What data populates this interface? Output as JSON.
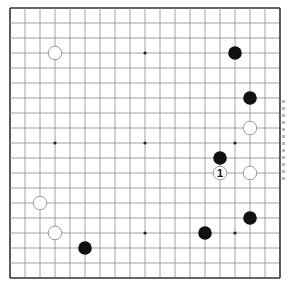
{
  "board": {
    "size": 19,
    "origin_x": 10,
    "origin_y": 8,
    "spacing": 15,
    "line_color": "#8a8a8a",
    "border_color": "#333333",
    "star_points": [
      [
        3,
        3
      ],
      [
        9,
        3
      ],
      [
        15,
        3
      ],
      [
        3,
        9
      ],
      [
        9,
        9
      ],
      [
        15,
        9
      ],
      [
        3,
        15
      ],
      [
        9,
        15
      ],
      [
        15,
        15
      ]
    ],
    "stones": [
      {
        "color": "white",
        "col": 3,
        "row": 3
      },
      {
        "color": "black",
        "col": 15,
        "row": 3
      },
      {
        "color": "black",
        "col": 16,
        "row": 6
      },
      {
        "color": "white",
        "col": 16,
        "row": 8
      },
      {
        "color": "black",
        "col": 14,
        "row": 10
      },
      {
        "color": "white",
        "col": 14,
        "row": 11,
        "label": "1"
      },
      {
        "color": "white",
        "col": 16,
        "row": 11
      },
      {
        "color": "white",
        "col": 2,
        "row": 13
      },
      {
        "color": "black",
        "col": 16,
        "row": 14
      },
      {
        "color": "white",
        "col": 3,
        "row": 15
      },
      {
        "color": "black",
        "col": 13,
        "row": 15
      },
      {
        "color": "black",
        "col": 5,
        "row": 16
      }
    ]
  },
  "colors": {
    "black_stone": "#111111",
    "white_stone_fill": "#ffffff",
    "white_stone_stroke": "#9a9a9a"
  }
}
